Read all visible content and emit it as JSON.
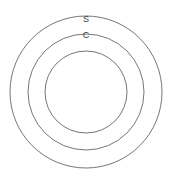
{
  "diagram": {
    "type": "concentric-circles",
    "background_color": "#ffffff",
    "stroke_color": "#777777",
    "label_color": "#3a3a3a",
    "center": {
      "x": 86,
      "y": 92
    },
    "circles": [
      {
        "name": "outer-circle",
        "radius": 76,
        "label": "S"
      },
      {
        "name": "middle-circle",
        "radius": 58,
        "label": "C"
      },
      {
        "name": "inner-circle",
        "radius": 41,
        "label": ""
      }
    ],
    "labels": [
      {
        "name": "label-s",
        "text": "S",
        "x": 86,
        "y": 20
      },
      {
        "name": "label-c",
        "text": "C",
        "x": 86,
        "y": 36
      }
    ]
  }
}
